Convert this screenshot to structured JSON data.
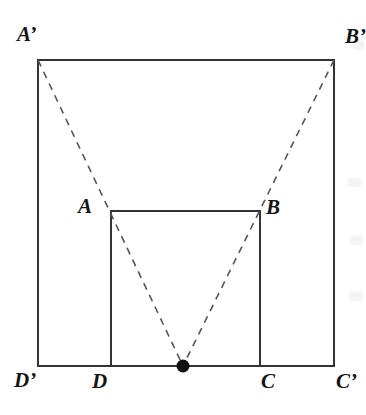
{
  "figure": {
    "background_color": "#ffffff",
    "stroke_color": "#333333",
    "dash_color": "#555555",
    "label_color": "#141414",
    "solid_stroke_width": 2,
    "dash_stroke_width": 1.6,
    "dash_pattern": "7 6"
  },
  "outer_square": {
    "name": "A'B'C'D'",
    "x": 38,
    "y": 60,
    "width": 296,
    "height": 306,
    "corners": {
      "top_left": [
        38,
        60
      ],
      "top_right": [
        334,
        60
      ],
      "bottom_right": [
        334,
        366
      ],
      "bottom_left": [
        38,
        366
      ]
    }
  },
  "inner_square": {
    "name": "ABCD",
    "x": 111,
    "y": 211,
    "width": 149,
    "height": 155,
    "corners": {
      "top_left": [
        111,
        211
      ],
      "top_right": [
        260,
        211
      ],
      "bottom_right": [
        260,
        366
      ],
      "bottom_left": [
        111,
        366
      ]
    }
  },
  "apex_point": {
    "label": "",
    "x": 183,
    "y": 366,
    "radius": 6.5,
    "fill": "#111111"
  },
  "dashed_lines": [
    {
      "name": "line-A-prime-to-apex",
      "from": [
        38,
        60
      ],
      "to": [
        183,
        366
      ],
      "through": [
        111,
        211
      ]
    },
    {
      "name": "line-B-prime-to-apex",
      "from": [
        334,
        60
      ],
      "to": [
        183,
        366
      ],
      "through": [
        260,
        212
      ]
    }
  ],
  "labels": [
    {
      "id": "a-prime",
      "text": "A’",
      "x": 17,
      "y": 24
    },
    {
      "id": "b-prime",
      "text": "B’",
      "x": 345,
      "y": 26
    },
    {
      "id": "a",
      "text": "A",
      "x": 78,
      "y": 196
    },
    {
      "id": "b",
      "text": "B",
      "x": 266,
      "y": 197
    },
    {
      "id": "d-prime",
      "text": "D’",
      "x": 14,
      "y": 370
    },
    {
      "id": "d",
      "text": "D",
      "x": 92,
      "y": 371
    },
    {
      "id": "c",
      "text": "C",
      "x": 261,
      "y": 371
    },
    {
      "id": "c-prime",
      "text": "C’",
      "x": 336,
      "y": 371
    }
  ]
}
